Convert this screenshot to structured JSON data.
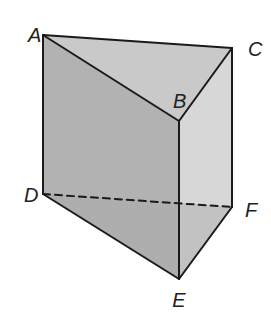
{
  "diagram": {
    "type": "triangular-prism",
    "vertices": {
      "A": {
        "label": "A",
        "x": 43,
        "y": 35,
        "lx": 28,
        "ly": 42
      },
      "B": {
        "label": "B",
        "x": 179,
        "y": 121,
        "lx": 173,
        "ly": 108
      },
      "C": {
        "label": "C",
        "x": 232,
        "y": 48,
        "lx": 248,
        "ly": 56
      },
      "D": {
        "label": "D",
        "x": 43,
        "y": 194,
        "lx": 24,
        "ly": 202
      },
      "E": {
        "label": "E",
        "x": 179,
        "y": 279,
        "lx": 179,
        "ly": 307
      },
      "F": {
        "label": "F",
        "x": 232,
        "y": 207,
        "lx": 245,
        "ly": 217
      }
    },
    "edges": {
      "solid": [
        "AB",
        "BC",
        "CA",
        "AD",
        "BE",
        "CF",
        "DE",
        "EF"
      ],
      "hidden": [
        "DF"
      ]
    },
    "colors": {
      "top_face": "#c9c9c9",
      "left_face": "#b2b2b2",
      "right_face": "#d7d7d7",
      "bottom_face": "#a8a8a8",
      "edge": "#1a1a1a"
    }
  }
}
